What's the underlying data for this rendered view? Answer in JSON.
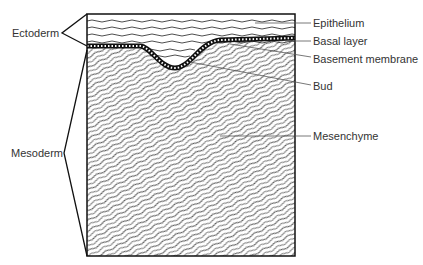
{
  "diagram": {
    "left_labels": {
      "ectoderm": "Ectoderm",
      "mesoderm": "Mesoderm"
    },
    "right_labels": {
      "epithelium": "Epithelium",
      "basal_layer": "Basal layer",
      "basement_membrane": "Basement membrane",
      "bud": "Bud",
      "mesenchyme": "Mesenchyme"
    },
    "colors": {
      "line": "#111111",
      "label": "#333333",
      "leader": "#555555"
    }
  }
}
